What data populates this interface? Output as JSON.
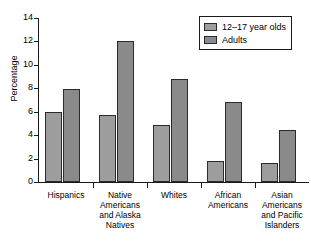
{
  "chart_data": {
    "type": "bar",
    "title": "",
    "xlabel": "",
    "ylabel": "Percentage",
    "ylim": [
      0,
      14
    ],
    "y_ticks": [
      "0",
      "2",
      "4",
      "6",
      "8",
      "10",
      "12",
      "14"
    ],
    "grid": false,
    "legend_position": "top-right",
    "categories": [
      "Hispanics",
      "Native Americans and Alaska Natives",
      "Whites",
      "African Americans",
      "Asian Americans and Pacific Islanders"
    ],
    "category_labels_wrapped": [
      "Hispanics",
      "Native\nAmericans\nand Alaska\nNatives",
      "Whites",
      "African\nAmericans",
      "Asian\nAmericans\nand Pacific\nIslanders"
    ],
    "series": [
      {
        "name": "12–17 year olds",
        "color": "#9d9d9d",
        "values": [
          6.0,
          5.7,
          4.9,
          1.8,
          1.6
        ]
      },
      {
        "name": "Adults",
        "color": "#8a8a8a",
        "values": [
          7.9,
          12.0,
          8.8,
          6.8,
          4.4
        ]
      }
    ]
  },
  "legend": {
    "entries": [
      {
        "label": "12–17 year olds"
      },
      {
        "label": "Adults"
      }
    ]
  }
}
